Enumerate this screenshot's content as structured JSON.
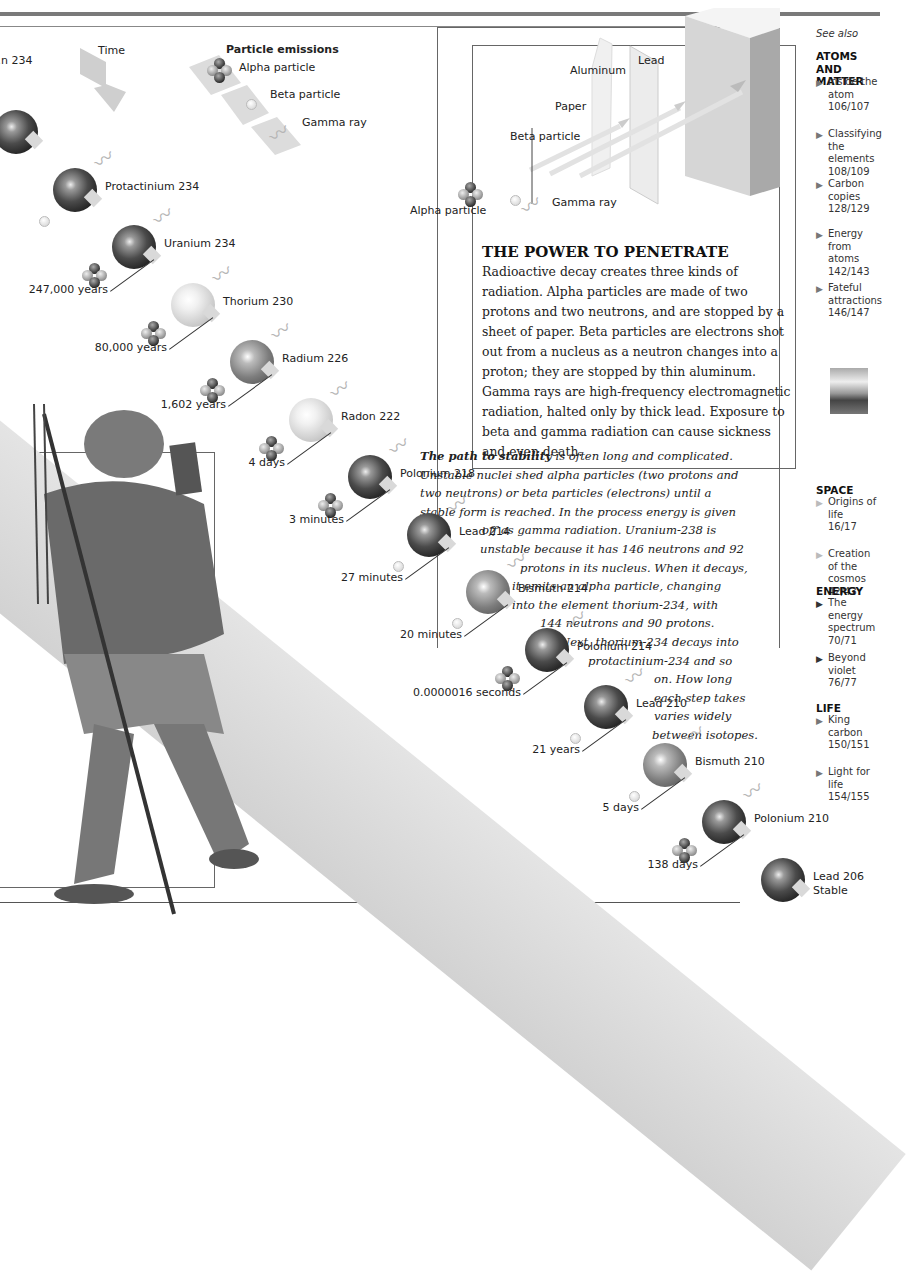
{
  "page": {
    "time_label": "Time",
    "emissions": {
      "title": "Particle emissions",
      "alpha": "Alpha particle",
      "beta": "Beta particle",
      "gamma": "Gamma ray"
    }
  },
  "penetration_diagram": {
    "labels": {
      "lead": "Lead",
      "aluminum": "Aluminum",
      "paper": "Paper",
      "beta": "Beta particle",
      "alpha": "Alpha particle",
      "gamma": "Gamma ray"
    },
    "heading": "THE POWER TO PENETRATE",
    "body": "Radioactive decay creates three kinds of radiation. Alpha particles are made of two protons and two neutrons, and are stopped by a sheet of paper. Beta particles are electrons shot out from a nucleus as a neutron changes into a proton; they are stopped by thin aluminum. Gamma rays are high-frequency electromagnetic radiation, halted only by thick lead. Exposure to beta and gamma radiation can cause sickness and even death."
  },
  "stability_text": {
    "lead_in": "The path to stability",
    "lines": [
      " is often long and complicated.",
      "Unstable nuclei shed alpha particles (two protons and",
      "two neutrons) or beta particles (electrons) until a",
      "stable form is reached. In the process energy is given",
      "off as gamma radiation. Uranium-238 is",
      "unstable because it has 146 neutrons and 92",
      "protons in its nucleus. When it decays,",
      "it emits an alpha particle, changing",
      "into the element thorium-234, with",
      "144 neutrons and 90 protons.",
      "Next, thorium-234 decays into",
      "protactinium-234 and so",
      "on. How long",
      "each step takes",
      "varies widely",
      "between isotopes."
    ]
  },
  "decay_chain": [
    {
      "name": "…n 234",
      "shade": "dark",
      "emission": "",
      "half_life": ""
    },
    {
      "name": "Protactinium 234",
      "shade": "dark",
      "emission": "beta",
      "half_life": ""
    },
    {
      "name": "Uranium 234",
      "shade": "dark",
      "emission": "alpha",
      "half_life": "247,000 years"
    },
    {
      "name": "Thorium 230",
      "shade": "light",
      "emission": "alpha",
      "half_life": "80,000 years"
    },
    {
      "name": "Radium 226",
      "shade": "mid",
      "emission": "alpha",
      "half_life": "1,602 years"
    },
    {
      "name": "Radon 222",
      "shade": "light",
      "emission": "alpha",
      "half_life": "4 days"
    },
    {
      "name": "Polonium 218",
      "shade": "dark",
      "emission": "alpha",
      "half_life": "3 minutes"
    },
    {
      "name": "Lead 214",
      "shade": "dark",
      "emission": "beta",
      "half_life": "27 minutes"
    },
    {
      "name": "Bismuth 214",
      "shade": "mid",
      "emission": "beta",
      "half_life": "20 minutes"
    },
    {
      "name": "Polonium 214",
      "shade": "dark",
      "emission": "alpha",
      "half_life": "0.0000016 seconds"
    },
    {
      "name": "Lead 210",
      "shade": "dark",
      "emission": "beta",
      "half_life": "21 years"
    },
    {
      "name": "Bismuth 210",
      "shade": "mid",
      "emission": "beta",
      "half_life": "5 days"
    },
    {
      "name": "Polonium 210",
      "shade": "dark",
      "emission": "alpha",
      "half_life": "138 days"
    },
    {
      "name": "Lead 206",
      "subtitle": "Stable",
      "shade": "dark",
      "emission": "",
      "half_life": ""
    }
  ],
  "see_also": {
    "title": "See also",
    "groups": [
      {
        "heading": "ATOMS AND MATTER",
        "items": [
          {
            "label": "Inside the atom",
            "pages": "106/107"
          },
          {
            "label": "Classifying the elements",
            "pages": "108/109"
          },
          {
            "label": "Carbon copies",
            "pages": "128/129"
          },
          {
            "label": "Energy from atoms",
            "pages": "142/143"
          },
          {
            "label": "Fateful attractions",
            "pages": "146/147"
          }
        ]
      },
      {
        "heading": "SPACE",
        "items": [
          {
            "label": "Origins of life",
            "pages": "16/17"
          },
          {
            "label": "Creation of the cosmos",
            "pages": "42/43"
          }
        ]
      },
      {
        "heading": "ENERGY",
        "items": [
          {
            "label": "The energy spectrum",
            "pages": "70/71"
          },
          {
            "label": "Beyond violet",
            "pages": "76/77"
          }
        ]
      },
      {
        "heading": "LIFE",
        "items": [
          {
            "label": "King carbon",
            "pages": "150/151"
          },
          {
            "label": "Light for life",
            "pages": "154/155"
          }
        ]
      }
    ]
  }
}
